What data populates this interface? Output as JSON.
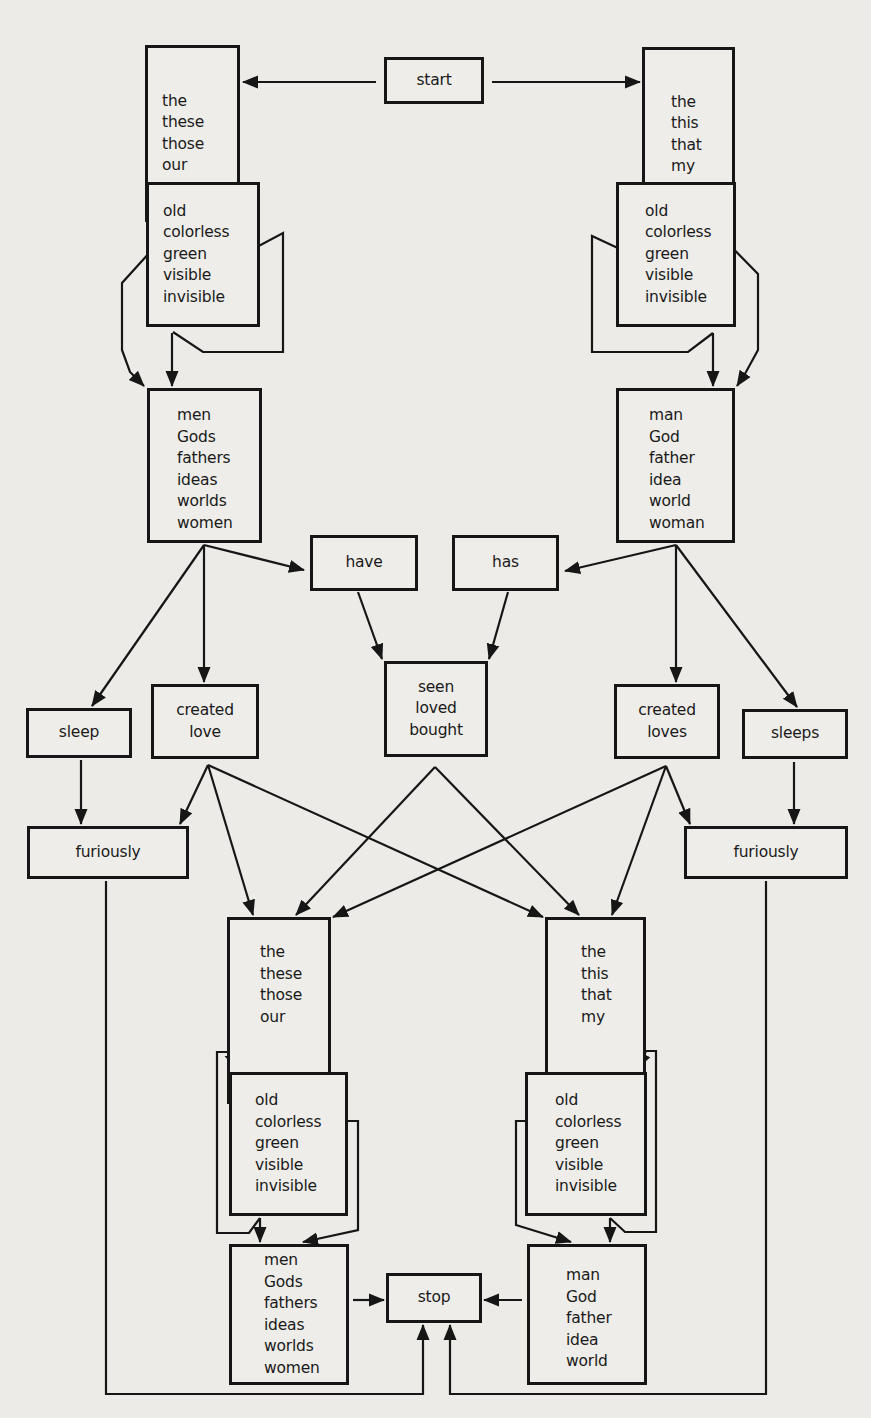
{
  "diagram": {
    "type": "finite-state grammar diagram",
    "colors": {
      "ink": "#161616",
      "paper": "#ecebe8"
    },
    "nodes": [
      {
        "id": "start",
        "words": [
          "start"
        ],
        "box": [
          384,
          57,
          100,
          47
        ],
        "align": "center"
      },
      {
        "id": "det_pl_top",
        "words": [
          "the",
          "these",
          "those",
          "our"
        ],
        "box": [
          145,
          45,
          95,
          177
        ],
        "align": "left"
      },
      {
        "id": "det_sg_top",
        "words": [
          "the",
          "this",
          "that",
          "my"
        ],
        "box": [
          642,
          47,
          93,
          175
        ],
        "align": "center"
      },
      {
        "id": "adj_left_top",
        "words": [
          "old",
          "colorless",
          "green",
          "visible",
          "invisible"
        ],
        "box": [
          146,
          182,
          114,
          145
        ],
        "align": "left"
      },
      {
        "id": "adj_right_top",
        "words": [
          "old",
          "colorless",
          "green",
          "visible",
          "invisible"
        ],
        "box": [
          616,
          182,
          120,
          145
        ],
        "align": "left"
      },
      {
        "id": "noun_pl_top",
        "words": [
          "men",
          "Gods",
          "fathers",
          "ideas",
          "worlds",
          "women"
        ],
        "box": [
          147,
          388,
          115,
          155
        ],
        "align": "left"
      },
      {
        "id": "noun_sg_top",
        "words": [
          "man",
          "God",
          "father",
          "idea",
          "world",
          "woman"
        ],
        "box": [
          616,
          388,
          119,
          155
        ],
        "align": "left"
      },
      {
        "id": "have",
        "words": [
          "have"
        ],
        "box": [
          310,
          535,
          108,
          56
        ],
        "align": "center"
      },
      {
        "id": "has",
        "words": [
          "has"
        ],
        "box": [
          452,
          535,
          107,
          56
        ],
        "align": "center"
      },
      {
        "id": "participle",
        "words": [
          "seen",
          "loved",
          "bought"
        ],
        "box": [
          384,
          661,
          104,
          96
        ],
        "align": "center"
      },
      {
        "id": "sleep",
        "words": [
          "sleep"
        ],
        "box": [
          26,
          708,
          106,
          50
        ],
        "align": "center"
      },
      {
        "id": "created_love",
        "words": [
          "created",
          "love"
        ],
        "box": [
          151,
          684,
          108,
          75
        ],
        "align": "center"
      },
      {
        "id": "created_loves",
        "words": [
          "created",
          "loves"
        ],
        "box": [
          614,
          684,
          106,
          75
        ],
        "align": "center"
      },
      {
        "id": "sleeps",
        "words": [
          "sleeps"
        ],
        "box": [
          742,
          709,
          106,
          50
        ],
        "align": "center"
      },
      {
        "id": "furiously_left",
        "words": [
          "furiously"
        ],
        "box": [
          27,
          826,
          162,
          53
        ],
        "align": "center"
      },
      {
        "id": "furiously_right",
        "words": [
          "furiously"
        ],
        "box": [
          684,
          826,
          164,
          53
        ],
        "align": "center"
      },
      {
        "id": "det_pl_bottom",
        "words": [
          "the",
          "these",
          "those",
          "our"
        ],
        "box": [
          227,
          917,
          104,
          187
        ],
        "align": "left"
      },
      {
        "id": "det_sg_bottom",
        "words": [
          "the",
          "this",
          "that",
          "my"
        ],
        "box": [
          545,
          917,
          101,
          187
        ],
        "align": "left"
      },
      {
        "id": "adj_left_bottom",
        "words": [
          "old",
          "colorless",
          "green",
          "visible",
          "invisible"
        ],
        "box": [
          229,
          1072,
          119,
          144
        ],
        "align": "left"
      },
      {
        "id": "adj_right_bottom",
        "words": [
          "old",
          "colorless",
          "green",
          "visible",
          "invisible"
        ],
        "box": [
          525,
          1072,
          122,
          144
        ],
        "align": "left"
      },
      {
        "id": "noun_pl_bottom",
        "words": [
          "men",
          "Gods",
          "fathers",
          "ideas",
          "worlds",
          "women"
        ],
        "box": [
          229,
          1244,
          120,
          141
        ],
        "align": "left"
      },
      {
        "id": "stop",
        "words": [
          "stop"
        ],
        "box": [
          386,
          1273,
          96,
          50
        ],
        "align": "center"
      },
      {
        "id": "noun_sg_bottom",
        "words": [
          "man",
          "God",
          "father",
          "idea",
          "world"
        ],
        "box": [
          527,
          1244,
          120,
          141
        ],
        "align": "left"
      }
    ],
    "edges": [
      {
        "from": "start",
        "to": "det_pl_top",
        "pts": [
          [
            377,
            81
          ],
          [
            242,
            81
          ]
        ]
      },
      {
        "from": "start",
        "to": "det_sg_top",
        "pts": [
          [
            491,
            81
          ],
          [
            640,
            81
          ]
        ]
      },
      {
        "from": "det_pl_top",
        "to": "adj_left_top",
        "pts": [
          [
            172,
            224
          ],
          [
            172,
            180
          ]
        ],
        "note": "vertical"
      },
      {
        "from": "det_sg_top",
        "to": "adj_right_top",
        "pts": [
          [
            713,
            224
          ],
          [
            713,
            180
          ]
        ],
        "note": "vertical"
      },
      {
        "from": "adj_left_top",
        "to": "adj_left_top",
        "loop": true
      },
      {
        "from": "adj_right_top",
        "to": "adj_right_top",
        "loop": true
      },
      {
        "from": "adj_left_top",
        "to": "noun_pl_top"
      },
      {
        "from": "det_pl_top",
        "to": "noun_pl_top",
        "note": "bypass"
      },
      {
        "from": "adj_right_top",
        "to": "noun_sg_top"
      },
      {
        "from": "det_sg_top",
        "to": "noun_sg_top",
        "note": "bypass"
      },
      {
        "from": "noun_pl_top",
        "to": "have"
      },
      {
        "from": "noun_pl_top",
        "to": "created_love"
      },
      {
        "from": "noun_pl_top",
        "to": "sleep"
      },
      {
        "from": "noun_sg_top",
        "to": "has"
      },
      {
        "from": "noun_sg_top",
        "to": "created_loves"
      },
      {
        "from": "noun_sg_top",
        "to": "sleeps"
      },
      {
        "from": "have",
        "to": "participle"
      },
      {
        "from": "has",
        "to": "participle"
      },
      {
        "from": "sleep",
        "to": "furiously_left"
      },
      {
        "from": "sleeps",
        "to": "furiously_right"
      },
      {
        "from": "created_love",
        "to": "furiously_left"
      },
      {
        "from": "created_love",
        "to": "det_pl_bottom"
      },
      {
        "from": "created_love",
        "to": "det_sg_bottom"
      },
      {
        "from": "participle",
        "to": "det_pl_bottom"
      },
      {
        "from": "participle",
        "to": "det_sg_bottom"
      },
      {
        "from": "created_loves",
        "to": "det_pl_bottom"
      },
      {
        "from": "created_loves",
        "to": "det_sg_bottom"
      },
      {
        "from": "created_loves",
        "to": "furiously_right"
      },
      {
        "from": "det_pl_bottom",
        "to": "adj_left_bottom"
      },
      {
        "from": "det_sg_bottom",
        "to": "adj_right_bottom"
      },
      {
        "from": "adj_left_bottom",
        "to": "adj_left_bottom",
        "loop": true
      },
      {
        "from": "adj_right_bottom",
        "to": "adj_right_bottom",
        "loop": true
      },
      {
        "from": "adj_left_bottom",
        "to": "noun_pl_bottom"
      },
      {
        "from": "adj_right_bottom",
        "to": "noun_sg_bottom"
      },
      {
        "from": "noun_pl_bottom",
        "to": "stop"
      },
      {
        "from": "noun_sg_bottom",
        "to": "stop"
      },
      {
        "from": "furiously_left",
        "to": "stop"
      },
      {
        "from": "furiously_right",
        "to": "stop"
      }
    ]
  }
}
